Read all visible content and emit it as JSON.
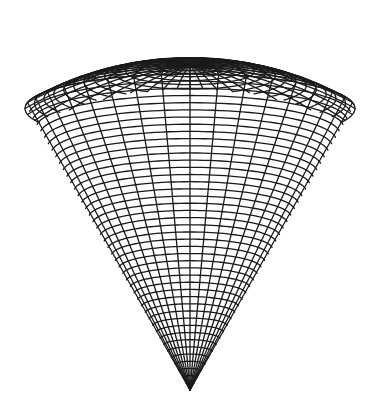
{
  "figure": {
    "background": "#ffffff",
    "stroke_color": "#1a1a1a",
    "stroke_width": 1.3,
    "apex": [
      190,
      390
    ],
    "center_x": 190,
    "rim_half_width": 165,
    "half_angle_deg": 30,
    "view_tilt_deg": 12,
    "vertical_scale": 1.06,
    "meridians": 36,
    "cone_rings": 44,
    "cap_rings": 16,
    "segments": 120
  }
}
